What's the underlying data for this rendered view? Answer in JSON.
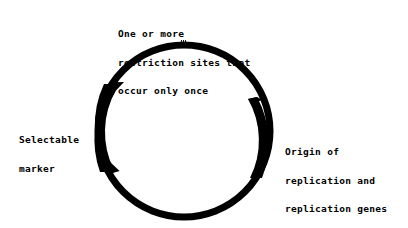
{
  "diagram": {
    "labels": {
      "restriction_sites": [
        "One or more",
        "restriction sites that",
        "occur only once"
      ],
      "selectable_marker": [
        "Selectable",
        "marker"
      ],
      "origin": [
        "Origin of",
        "replication and",
        "replication genes"
      ]
    },
    "colors": {
      "ink": "#000000",
      "background": "#ffffff"
    }
  }
}
